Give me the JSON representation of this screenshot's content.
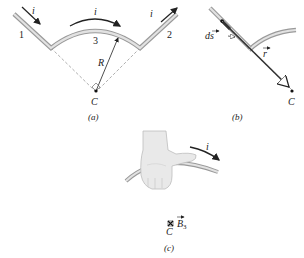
{
  "panel_a": {
    "caption": "(a)",
    "segment_1_label": "1",
    "segment_2_label": "2",
    "segment_3_label": "3",
    "current_label_left": "i",
    "current_label_arc": "i",
    "current_label_right": "i",
    "radius_label": "R",
    "center_label": "C"
  },
  "panel_b": {
    "caption": "(b)",
    "ds_label": "ds",
    "r_label": "r",
    "center_label": "C"
  },
  "panel_c": {
    "caption": "(c)",
    "current_label": "i",
    "field_label": "B",
    "field_subscript": "3",
    "center_label": "C"
  },
  "colors": {
    "wire_outer": "#9a9a9a",
    "wire_inner": "#e2e2e2",
    "arrow": "#222222",
    "dashed": "#9a9a9a",
    "hand": "#e9e9e9",
    "hand_outline": "#bdbdbd"
  }
}
